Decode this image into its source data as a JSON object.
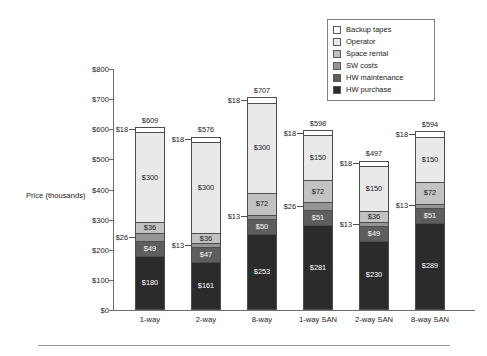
{
  "chart_data": {
    "type": "bar",
    "subtype": "stacked-bar",
    "title": "",
    "xlabel": "",
    "ylabel": "Price (thousands)",
    "ylim": [
      0,
      800
    ],
    "ytick_step": 100,
    "ytick_labels": [
      "$800",
      "$700",
      "$600",
      "$500",
      "$400",
      "$300",
      "$200",
      "$100",
      "$0"
    ],
    "ytick_values": [
      800,
      700,
      600,
      500,
      400,
      300,
      200,
      100,
      0
    ],
    "grid": false,
    "legend_position": "top-right",
    "categories": [
      "1-way",
      "2-way",
      "8-way",
      "1-way SAN",
      "2-way SAN",
      "8-way SAN"
    ],
    "totals": [
      609,
      576,
      707,
      598,
      497,
      594
    ],
    "total_labels": [
      "$609",
      "$576",
      "$707",
      "$598",
      "$497",
      "$594"
    ],
    "series": [
      {
        "name": "Backup tapes",
        "color": "#ffffff",
        "values": [
          18,
          18,
          18,
          18,
          18,
          18
        ],
        "labels": [
          "$18",
          "$18",
          "$18",
          "$18",
          "$18",
          "$18"
        ],
        "label_placement": "callout"
      },
      {
        "name": "Operator",
        "color": "#e9e9e9",
        "values": [
          300,
          300,
          300,
          150,
          150,
          150
        ],
        "labels": [
          "$300",
          "$300",
          "$300",
          "$150",
          "$150",
          "$150"
        ],
        "label_placement": "inside"
      },
      {
        "name": "Space rental",
        "color": "#c2c2c2",
        "values": [
          36,
          36,
          72,
          72,
          36,
          72
        ],
        "labels": [
          "$36",
          "$36",
          "$72",
          "$72",
          "$36",
          "$72"
        ],
        "label_placement": "inside"
      },
      {
        "name": "SW costs",
        "color": "#949494",
        "values": [
          26,
          13,
          13,
          26,
          13,
          13
        ],
        "labels": [
          "$26",
          "$13",
          "$13",
          "$26",
          "$13",
          "$13"
        ],
        "label_placement": "mixed"
      },
      {
        "name": "HW maintenance",
        "color": "#5e5e5e",
        "values": [
          49,
          47,
          50,
          51,
          49,
          51
        ],
        "labels": [
          "$49",
          "$47",
          "$50",
          "$51",
          "$49",
          "$51"
        ],
        "label_placement": "inside"
      },
      {
        "name": "HW purchase",
        "color": "#2b2b2b",
        "values": [
          180,
          161,
          253,
          281,
          230,
          289
        ],
        "labels": [
          "$180",
          "$161",
          "$253",
          "$281",
          "$230",
          "$289"
        ],
        "label_placement": "inside"
      }
    ]
  },
  "legend": {
    "items": [
      {
        "label": "Backup tapes",
        "color": "#ffffff"
      },
      {
        "label": "Operator",
        "color": "#e9e9e9"
      },
      {
        "label": "Space rental",
        "color": "#c2c2c2"
      },
      {
        "label": "SW costs",
        "color": "#949494"
      },
      {
        "label": "HW maintenance",
        "color": "#5e5e5e"
      },
      {
        "label": "HW purchase",
        "color": "#2b2b2b"
      }
    ]
  }
}
